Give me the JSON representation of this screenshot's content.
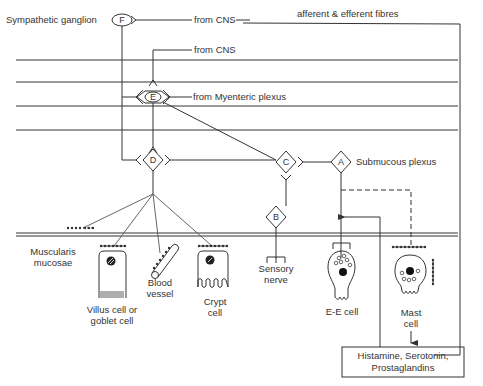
{
  "diagram": {
    "type": "enteric nervous system innervation schematic",
    "colors": {
      "ink": "#333333",
      "background": "#ffffff"
    },
    "labels": {
      "sympathetic_ganglion": "Sympathetic ganglion",
      "from_cns_top": "from CNS",
      "afferent_efferent": "afferent & efferent fibres",
      "from_cns_second": "from CNS",
      "from_myenteric": "from Myenteric plexus",
      "submucous_plexus": "Submucous plexus",
      "muscularis_line1": "Muscularis",
      "muscularis_line2": "mucosae"
    },
    "nodes": [
      {
        "id": "F",
        "label": "F",
        "shape": "ellipse"
      },
      {
        "id": "E",
        "label": "E",
        "shape": "ellipse"
      },
      {
        "id": "D",
        "label": "D",
        "shape": "diamond"
      },
      {
        "id": "C",
        "label": "C",
        "shape": "diamond"
      },
      {
        "id": "A",
        "label": "A",
        "shape": "diamond"
      },
      {
        "id": "B",
        "label": "B",
        "shape": "diamond"
      }
    ],
    "cells": {
      "villus": {
        "line1": "Villus cell or",
        "line2": "goblet cell"
      },
      "blood_vessel": {
        "line1": "Blood",
        "line2": "vessel"
      },
      "crypt": {
        "line1": "Crypt",
        "line2": "cell"
      },
      "sensory_nerve": {
        "line1": "Sensory",
        "line2": "nerve"
      },
      "ee_cell": {
        "line1": "E-E cell"
      },
      "mast_cell": {
        "line1": "Mast",
        "line2": "cell"
      }
    },
    "mediators_box": {
      "line1": "Histamine, Serotonin,",
      "line2": "Prostaglandins"
    }
  }
}
